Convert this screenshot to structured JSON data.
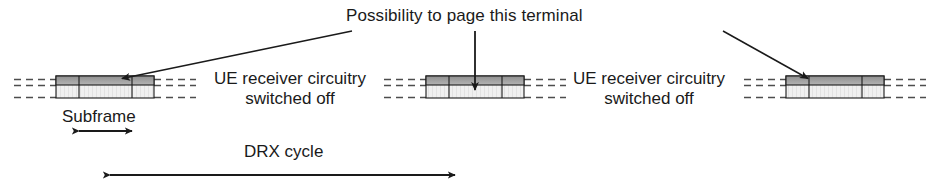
{
  "diagram": {
    "type": "drx-cycle-timing-diagram",
    "title": "Possibility to page this terminal",
    "labels": {
      "circuitry_line1": "UE receiver circuitry",
      "circuitry_line2": "switched off",
      "subframe": "Subframe",
      "drx_cycle": "DRX cycle"
    },
    "colors": {
      "stroke": "#1a1a1a",
      "block_body_fill": "#efefef",
      "block_top_band_fill": "#9a9a9a",
      "dashed_line": "#4d4d4d",
      "background": "#ffffff"
    },
    "blocks": [
      {
        "name": "on-duration-block-left",
        "x": 56,
        "y": 76,
        "width": 98,
        "height": 22,
        "dividers": [
          23,
          76
        ],
        "dash_left": {
          "x1": 14,
          "x2": 56
        },
        "dash_right": {
          "x1": 154,
          "x2": 196
        },
        "arrow": "paging-arrow-left"
      },
      {
        "name": "on-duration-block-middle",
        "x": 426,
        "y": 76,
        "width": 98,
        "height": 22,
        "dividers": [
          23,
          76
        ],
        "dash_left": {
          "x1": 384,
          "x2": 426
        },
        "dash_right": {
          "x1": 524,
          "x2": 566
        },
        "arrow": "paging-arrow-middle"
      },
      {
        "name": "on-duration-block-right",
        "x": 786,
        "y": 76,
        "width": 98,
        "height": 22,
        "dividers": [
          23,
          76
        ],
        "dash_left": {
          "x1": 744,
          "x2": 786
        },
        "dash_right": {
          "x1": 884,
          "x2": 926
        },
        "arrow": "paging-arrow-right"
      }
    ],
    "measures": [
      {
        "name": "subframe-measure",
        "label": "Subframe",
        "x1": 79,
        "x2": 132,
        "y": 131,
        "arrowheads": "both"
      },
      {
        "name": "drx-cycle-measure",
        "label": "DRX cycle",
        "x1": 110,
        "x2": 455,
        "y": 175,
        "arrowheads": "both"
      }
    ],
    "leaders": [
      {
        "name": "leader-left",
        "from": [
          352,
          31
        ],
        "to": [
          118,
          78
        ]
      },
      {
        "name": "leader-middle",
        "from": [
          475,
          31
        ],
        "to": [
          475,
          76
        ]
      },
      {
        "name": "leader-right",
        "from": [
          723,
          31
        ],
        "to": [
          812,
          78
        ]
      }
    ]
  }
}
